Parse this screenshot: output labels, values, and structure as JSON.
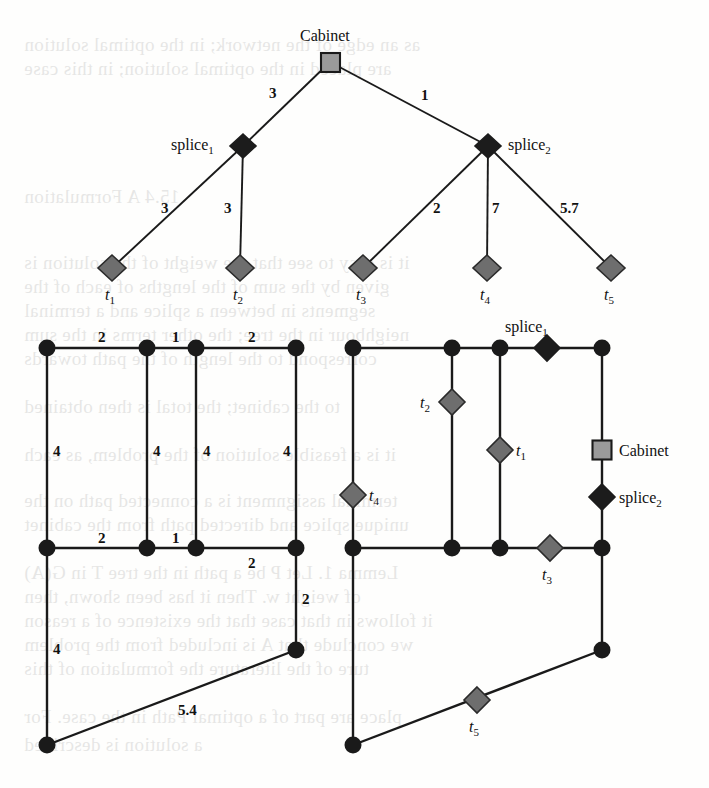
{
  "figure": {
    "colors": {
      "line": "#1a1a1a",
      "terminal_fill": "#6e6e6e",
      "splice_fill": "#1c1c1c",
      "cabinet_fill": "#9a9a9a",
      "node_fill": "#1a1a1a",
      "background": "#fefefd"
    }
  },
  "tree": {
    "root": {
      "label": "Cabinet",
      "shape": "square"
    },
    "splices": [
      {
        "label": "splice",
        "sub": "1"
      },
      {
        "label": "splice",
        "sub": "2"
      }
    ],
    "terminals": [
      {
        "label": "t",
        "sub": "1"
      },
      {
        "label": "t",
        "sub": "2"
      },
      {
        "label": "t",
        "sub": "3"
      },
      {
        "label": "t",
        "sub": "4"
      },
      {
        "label": "t",
        "sub": "5"
      }
    ],
    "edges": [
      {
        "from": "Cabinet",
        "to": "splice1",
        "weight": "3"
      },
      {
        "from": "Cabinet",
        "to": "splice2",
        "weight": "1"
      },
      {
        "from": "splice1",
        "to": "t1",
        "weight": "3"
      },
      {
        "from": "splice1",
        "to": "t2",
        "weight": "3"
      },
      {
        "from": "splice2",
        "to": "t3",
        "weight": "2"
      },
      {
        "from": "splice2",
        "to": "t4",
        "weight": "7"
      },
      {
        "from": "splice2",
        "to": "t5",
        "weight": "5.7"
      }
    ]
  },
  "left_network": {
    "caption": "street network with edge lengths",
    "edge_labels": [
      {
        "value": "2",
        "x": 98,
        "y": 330
      },
      {
        "value": "1",
        "x": 172,
        "y": 330
      },
      {
        "value": "2",
        "x": 248,
        "y": 330
      },
      {
        "value": "4",
        "x": 53,
        "y": 444
      },
      {
        "value": "4",
        "x": 153,
        "y": 444
      },
      {
        "value": "4",
        "x": 203,
        "y": 444
      },
      {
        "value": "4",
        "x": 283,
        "y": 444
      },
      {
        "value": "2",
        "x": 98,
        "y": 531
      },
      {
        "value": "1",
        "x": 172,
        "y": 531
      },
      {
        "value": "2",
        "x": 248,
        "y": 556
      },
      {
        "value": "2",
        "x": 302,
        "y": 592
      },
      {
        "value": "4",
        "x": 53,
        "y": 642
      },
      {
        "value": "5.4",
        "x": 178,
        "y": 703
      }
    ]
  },
  "right_network": {
    "caption": "same network with cabinet, splices and terminals placed",
    "placed": [
      {
        "label": "splice",
        "sub": "1",
        "shape": "splice",
        "x": 547,
        "y": 348,
        "text_x": 505,
        "text_y": 319
      },
      {
        "label": "t",
        "sub": "2",
        "shape": "terminal",
        "x": 452,
        "y": 402,
        "text_x": 420,
        "text_y": 395
      },
      {
        "label": "t",
        "sub": "1",
        "shape": "terminal",
        "x": 500,
        "y": 450,
        "text_x": 516,
        "text_y": 443
      },
      {
        "label": "Cabinet",
        "sub": "",
        "shape": "cabinet",
        "x": 602,
        "y": 450,
        "text_x": 619,
        "text_y": 443
      },
      {
        "label": "t",
        "sub": "4",
        "shape": "terminal",
        "x": 353,
        "y": 495,
        "text_x": 369,
        "text_y": 488
      },
      {
        "label": "splice",
        "sub": "2",
        "shape": "splice",
        "x": 602,
        "y": 497,
        "text_x": 619,
        "text_y": 490
      },
      {
        "label": "t",
        "sub": "3",
        "shape": "terminal",
        "x": 550,
        "y": 548,
        "text_x": 542,
        "text_y": 567
      },
      {
        "label": "t",
        "sub": "5",
        "shape": "terminal",
        "x": 477,
        "y": 700,
        "text_x": 469,
        "text_y": 719
      }
    ]
  },
  "background_text": [
    {
      "t": "as an edge of the network; in the optimal solution",
      "x": 24,
      "y": 34
    },
    {
      "t": "are placed in the optimal solution; in this case",
      "x": 24,
      "y": 58
    },
    {
      "t": "15.4   A Formulation",
      "x": 24,
      "y": 186
    },
    {
      "t": "it is easy to see that the weight of the solution is",
      "x": 24,
      "y": 252
    },
    {
      "t": "given by the sum of the lengths of each of the",
      "x": 24,
      "y": 276
    },
    {
      "t": "segments in between a splice and a terminal",
      "x": 24,
      "y": 300
    },
    {
      "t": "neighbour in the tree; the other terms in the sum",
      "x": 24,
      "y": 324
    },
    {
      "t": "correspond to the length of the path towards",
      "x": 24,
      "y": 348
    },
    {
      "t": "to the cabinet; the total is then obtained",
      "x": 24,
      "y": 396
    },
    {
      "t": "it is a feasible solution of the problem, as each",
      "x": 24,
      "y": 444
    },
    {
      "t": "terminal assignment is a connected path on the",
      "x": 24,
      "y": 490
    },
    {
      "t": "unique splice and directed path from the cabinet",
      "x": 24,
      "y": 514
    },
    {
      "t": "Lemma 1.  Let P be a path in the tree  T in G(A)",
      "x": 24,
      "y": 562
    },
    {
      "t": "of weight w. Then it has been shown, then",
      "x": 24,
      "y": 586
    },
    {
      "t": "it follows in that case that the existence of a reason",
      "x": 24,
      "y": 610
    },
    {
      "t": "we conclude that A is included from the problem",
      "x": 24,
      "y": 634
    },
    {
      "t": "ture of the literature the formulation of this",
      "x": 24,
      "y": 658
    },
    {
      "t": "place are part of a optimal Path in the case. For",
      "x": 24,
      "y": 706
    },
    {
      "t": "a solution is described",
      "x": 24,
      "y": 734
    }
  ]
}
